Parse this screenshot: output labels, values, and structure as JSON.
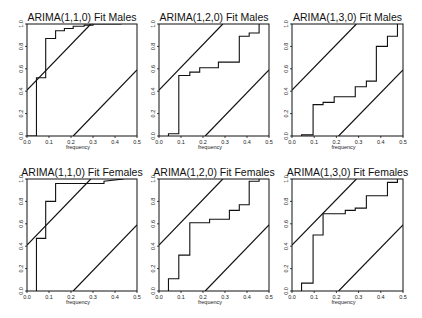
{
  "chart_data": [
    {
      "type": "line",
      "title": "ARIMA(1,1,0) Fit Males",
      "xlabel": "frequency",
      "ylabel": "",
      "xlim": [
        0.0,
        0.5
      ],
      "ylim": [
        0.0,
        1.0
      ],
      "xticks": [
        "0.0",
        "0.1",
        "0.2",
        "0.3",
        "0.4",
        "0.5"
      ],
      "yticks": [
        "0.0",
        "0.2",
        "0.4",
        "0.6",
        "0.8",
        "1.0"
      ],
      "grid": false,
      "series": [
        {
          "name": "cumulative periodogram",
          "kind": "step",
          "x": [
            0.0,
            0.043,
            0.043,
            0.085,
            0.085,
            0.13,
            0.13,
            0.17,
            0.17,
            0.21,
            0.21,
            0.26,
            0.26,
            0.3,
            0.3,
            0.35,
            0.35,
            0.43
          ],
          "y": [
            0.0,
            0.0,
            0.52,
            0.52,
            0.87,
            0.87,
            0.94,
            0.94,
            0.96,
            0.96,
            0.98,
            0.98,
            0.99,
            0.99,
            1.0,
            1.0,
            1.0,
            1.0
          ]
        },
        {
          "name": "upper bound",
          "kind": "line",
          "x": [
            0.0,
            0.29
          ],
          "y": [
            0.41,
            1.0
          ]
        },
        {
          "name": "lower bound",
          "kind": "line",
          "x": [
            0.21,
            0.5
          ],
          "y": [
            0.0,
            0.59
          ]
        }
      ]
    },
    {
      "type": "line",
      "title": "ARIMA(1,2,0) Fit Males",
      "xlabel": "frequency",
      "ylabel": "",
      "xlim": [
        0.0,
        0.5
      ],
      "ylim": [
        0.0,
        1.0
      ],
      "xticks": [
        "0.0",
        "0.1",
        "0.2",
        "0.3",
        "0.4",
        "0.5"
      ],
      "yticks": [
        "0.0",
        "0.2",
        "0.4",
        "0.6",
        "0.8",
        "1.0"
      ],
      "grid": false,
      "series": [
        {
          "name": "cumulative periodogram",
          "kind": "step",
          "x": [
            0.043,
            0.043,
            0.09,
            0.09,
            0.14,
            0.14,
            0.185,
            0.185,
            0.27,
            0.27,
            0.365,
            0.365,
            0.41,
            0.41,
            0.455,
            0.455
          ],
          "y": [
            0.0,
            0.02,
            0.02,
            0.54,
            0.54,
            0.57,
            0.57,
            0.61,
            0.61,
            0.66,
            0.66,
            0.89,
            0.89,
            0.92,
            0.92,
            1.0
          ]
        },
        {
          "name": "upper bound",
          "kind": "line",
          "x": [
            0.0,
            0.29
          ],
          "y": [
            0.41,
            1.0
          ]
        },
        {
          "name": "lower bound",
          "kind": "line",
          "x": [
            0.21,
            0.5
          ],
          "y": [
            0.0,
            0.59
          ]
        }
      ]
    },
    {
      "type": "line",
      "title": "ARIMA(1,3,0) Fit Males",
      "xlabel": "frequency",
      "ylabel": "",
      "xlim": [
        0.0,
        0.5
      ],
      "ylim": [
        0.0,
        1.0
      ],
      "xticks": [
        "0.0",
        "0.1",
        "0.2",
        "0.3",
        "0.4",
        "0.5"
      ],
      "yticks": [
        "0.0",
        "0.2",
        "0.4",
        "0.6",
        "0.8",
        "1.0"
      ],
      "grid": false,
      "series": [
        {
          "name": "cumulative periodogram",
          "kind": "step",
          "x": [
            0.043,
            0.043,
            0.095,
            0.095,
            0.14,
            0.14,
            0.19,
            0.19,
            0.285,
            0.285,
            0.335,
            0.335,
            0.38,
            0.38,
            0.43,
            0.43,
            0.475,
            0.475
          ],
          "y": [
            0.0,
            0.01,
            0.01,
            0.28,
            0.28,
            0.3,
            0.3,
            0.35,
            0.35,
            0.44,
            0.44,
            0.49,
            0.49,
            0.8,
            0.8,
            0.89,
            0.89,
            1.0
          ]
        },
        {
          "name": "upper bound",
          "kind": "line",
          "x": [
            0.0,
            0.29
          ],
          "y": [
            0.41,
            1.0
          ]
        },
        {
          "name": "lower bound",
          "kind": "line",
          "x": [
            0.21,
            0.5
          ],
          "y": [
            0.0,
            0.59
          ]
        }
      ]
    },
    {
      "type": "line",
      "title": "ARIMA(1,1,0) Fit Females",
      "xlabel": "frequency",
      "ylabel": "",
      "xlim": [
        0.0,
        0.5
      ],
      "ylim": [
        0.0,
        1.0
      ],
      "xticks": [
        "0.0",
        "0.1",
        "0.2",
        "0.3",
        "0.4",
        "0.5"
      ],
      "yticks": [
        "0.0",
        "0.2",
        "0.4",
        "0.6",
        "0.8",
        "1.0"
      ],
      "grid": false,
      "series": [
        {
          "name": "cumulative periodogram",
          "kind": "step",
          "x": [
            0.043,
            0.043,
            0.085,
            0.085,
            0.13,
            0.13,
            0.35,
            0.35,
            0.44
          ],
          "y": [
            0.0,
            0.47,
            0.47,
            0.8,
            0.8,
            0.96,
            0.96,
            0.98,
            1.0
          ]
        },
        {
          "name": "upper bound",
          "kind": "line",
          "x": [
            0.0,
            0.29
          ],
          "y": [
            0.41,
            1.0
          ]
        },
        {
          "name": "lower bound",
          "kind": "line",
          "x": [
            0.21,
            0.5
          ],
          "y": [
            0.0,
            0.59
          ]
        }
      ]
    },
    {
      "type": "line",
      "title": "ARIMA(1,2,0) Fit Females",
      "xlabel": "frequency",
      "ylabel": "",
      "xlim": [
        0.0,
        0.5
      ],
      "ylim": [
        0.0,
        1.0
      ],
      "xticks": [
        "0.0",
        "0.1",
        "0.2",
        "0.3",
        "0.4",
        "0.5"
      ],
      "yticks": [
        "0.0",
        "0.2",
        "0.4",
        "0.6",
        "0.8",
        "1.0"
      ],
      "grid": false,
      "series": [
        {
          "name": "cumulative periodogram",
          "kind": "step",
          "x": [
            0.043,
            0.043,
            0.09,
            0.09,
            0.14,
            0.14,
            0.23,
            0.23,
            0.32,
            0.32,
            0.365,
            0.365,
            0.41,
            0.41,
            0.455,
            0.455
          ],
          "y": [
            0.0,
            0.11,
            0.11,
            0.32,
            0.32,
            0.61,
            0.61,
            0.64,
            0.64,
            0.72,
            0.72,
            0.77,
            0.77,
            0.98,
            0.98,
            1.0
          ]
        },
        {
          "name": "upper bound",
          "kind": "line",
          "x": [
            0.0,
            0.29
          ],
          "y": [
            0.41,
            1.0
          ]
        },
        {
          "name": "lower bound",
          "kind": "line",
          "x": [
            0.21,
            0.5
          ],
          "y": [
            0.0,
            0.59
          ]
        }
      ]
    },
    {
      "type": "line",
      "title": "ARIMA(1,3,0) Fit Females",
      "xlabel": "frequency",
      "ylabel": "",
      "xlim": [
        0.0,
        0.5
      ],
      "ylim": [
        0.0,
        1.0
      ],
      "xticks": [
        "0.0",
        "0.1",
        "0.2",
        "0.3",
        "0.4",
        "0.5"
      ],
      "yticks": [
        "0.0",
        "0.2",
        "0.4",
        "0.6",
        "0.8",
        "1.0"
      ],
      "grid": false,
      "series": [
        {
          "name": "cumulative periodogram",
          "kind": "step",
          "x": [
            0.043,
            0.043,
            0.095,
            0.095,
            0.14,
            0.14,
            0.24,
            0.24,
            0.285,
            0.285,
            0.335,
            0.335,
            0.43,
            0.43,
            0.475,
            0.475
          ],
          "y": [
            0.0,
            0.07,
            0.07,
            0.5,
            0.5,
            0.69,
            0.69,
            0.72,
            0.72,
            0.74,
            0.74,
            0.85,
            0.85,
            0.97,
            0.97,
            1.0
          ]
        },
        {
          "name": "upper bound",
          "kind": "line",
          "x": [
            0.0,
            0.29
          ],
          "y": [
            0.41,
            1.0
          ]
        },
        {
          "name": "lower bound",
          "kind": "line",
          "x": [
            0.21,
            0.5
          ],
          "y": [
            0.0,
            0.59
          ]
        }
      ]
    }
  ],
  "layout": {
    "panels": [
      {
        "left": 27,
        "top": 24,
        "width": 110,
        "height": 112
      },
      {
        "left": 159,
        "top": 24,
        "width": 110,
        "height": 112
      },
      {
        "left": 292,
        "top": 24,
        "width": 111,
        "height": 112
      },
      {
        "left": 27,
        "top": 179,
        "width": 110,
        "height": 112
      },
      {
        "left": 159,
        "top": 179,
        "width": 110,
        "height": 112
      },
      {
        "left": 292,
        "top": 179,
        "width": 111,
        "height": 112
      }
    ],
    "line_color": "#111111",
    "background": "#ffffff"
  }
}
